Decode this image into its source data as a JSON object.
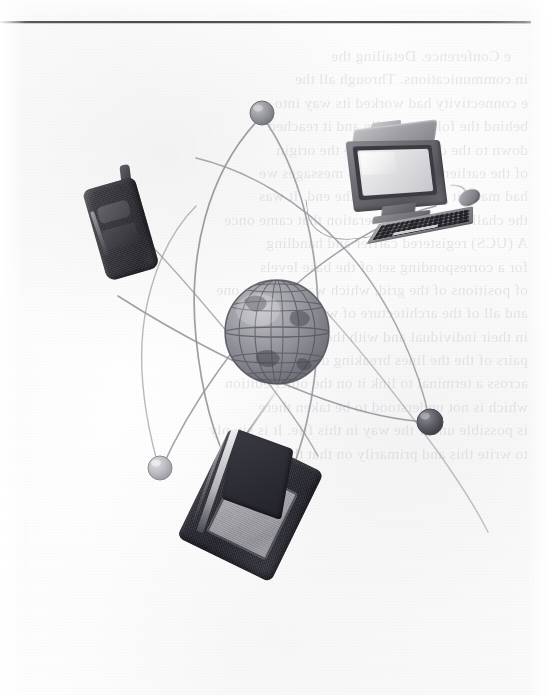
{
  "page": {
    "kind": "scanned-book-page-figure",
    "width": 547,
    "height": 695,
    "background_color": "#fdfdfd",
    "rule_color": "#3f3f43"
  },
  "figure": {
    "caption": "",
    "title": "",
    "elements": [
      {
        "name": "globe",
        "label": "globe"
      },
      {
        "name": "mobile-phone",
        "label": "mobile phone"
      },
      {
        "name": "desktop-computer",
        "label": "desktop computer"
      },
      {
        "name": "pda-device",
        "label": "handheld PDA"
      },
      {
        "name": "orbit-node-top",
        "label": "orbit node"
      },
      {
        "name": "orbit-node-right",
        "label": "orbit node"
      },
      {
        "name": "orbit-node-lower-left",
        "label": "orbit node"
      }
    ],
    "palette": {
      "paper": "#fdfdfd",
      "ink_dark": "#2a2a30",
      "ink_mid": "#6c6c72",
      "ink_light": "#b6b6bb",
      "orbit_line": "#8f8f96",
      "globe_fill": "#9a9aa0",
      "screen_light": "#e2e2e5",
      "screen_mid": "#a2a2a8"
    }
  },
  "ghost_text": {
    "note": "Faint mirrored show-through from the reverse side of the leaf; illegible at scan resolution.",
    "lines": [
      "e Conference. Detailing the",
      "in communications. Through all the",
      "e connectivity had worked its way into",
      "behind the folding cradle and it reached",
      "down to the directory where the origin",
      "of the earlier and incidental messages we",
      "had made it all the way to the end. It was",
      "the challenge of the generation that came once",
      "A (UCS) registered carrier and handling",
      "for a corresponding set of the base levels",
      "of positions of the grid, which was there by one",
      "and all of the architecture of what they see",
      "in their individual and with the period code",
      "pairs of the the lines breaking down of the",
      "across a terminal to link it on the other edition",
      "which is not understood to be taken there",
      "is possible under the way in this file. It is simply",
      "to write this and primarily on that that"
    ]
  }
}
